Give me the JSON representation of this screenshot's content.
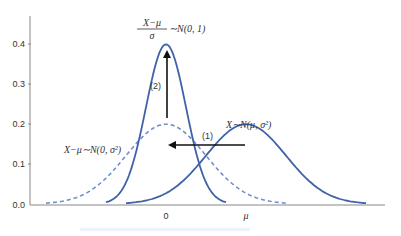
{
  "chart_data": {
    "type": "line",
    "title": "",
    "xlabel": "",
    "ylabel": "",
    "ylim": [
      0.0,
      0.45
    ],
    "yticks": [
      0.0,
      0.1,
      0.2,
      0.3,
      0.4
    ],
    "ytick_labels": [
      "0.0",
      "0.1",
      "0.2",
      "0.3",
      "0.4"
    ],
    "xticks": [
      0,
      4
    ],
    "xtick_labels": [
      "0",
      "μ"
    ],
    "grid": false,
    "legend": "none",
    "series": [
      {
        "name": "X ~ N(μ, σ²)",
        "distribution": "normal",
        "mean": 4,
        "sd": 2,
        "style": "solid",
        "peak": 0.199
      },
      {
        "name": "X − μ ~ N(0, σ²)",
        "distribution": "normal",
        "mean": 0,
        "sd": 2,
        "style": "dashed",
        "peak": 0.199
      },
      {
        "name": "(X − μ)/σ ~ N(0, 1)",
        "distribution": "normal",
        "mean": 0,
        "sd": 1,
        "style": "solid",
        "peak": 0.399
      }
    ],
    "annotations": [
      {
        "text": "X−μ ~ N(0, σ²)",
        "target": "dashed curve"
      },
      {
        "text": "X ~ N(μ, σ²)",
        "target": "shifted curve"
      },
      {
        "text": "(X−μ)/σ ~ N(0, 1)",
        "target": "standard normal"
      },
      {
        "text": "(1)",
        "arrow": "horizontal shift left from μ to 0"
      },
      {
        "text": "(2)",
        "arrow": "vertical stretch up to 0.4"
      }
    ]
  },
  "colors": {
    "curve": "#3f62a8",
    "dashed": "#6f8fd0",
    "axis": "#888888",
    "arrow": "#111111",
    "text": "#333333"
  },
  "labels": {
    "y0": "0.0",
    "y1": "0.1",
    "y2": "0.2",
    "y3": "0.3",
    "y4": "0.4",
    "x0": "0",
    "xmu": "μ",
    "curve_shifted": "X∼N(μ, σ²)",
    "curve_dashed": "X−μ∼N(0, σ²)",
    "std_num": "X−μ",
    "std_den": "σ",
    "std_rest": "∼N(0, 1)",
    "step1": "(1)",
    "step2": "(2)"
  }
}
